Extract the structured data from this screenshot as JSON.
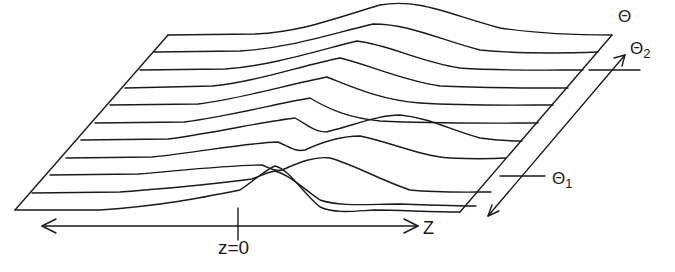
{
  "diagram": {
    "type": "3d-waterfall-profile",
    "background": "#ffffff",
    "stroke_color": "#1a1a1a",
    "axes": {
      "z": {
        "label": "Z",
        "origin_label": "z=0",
        "direction": "bidirectional-horizontal"
      },
      "theta": {
        "label": "Θ",
        "direction": "bidirectional-diagonal"
      }
    },
    "markers": {
      "theta1": {
        "label": "Θ",
        "subscript": "1"
      },
      "theta2": {
        "label": "Θ",
        "subscript": "2"
      }
    },
    "profiles": {
      "count": 11,
      "description": "Stacked profile curves along z; a hump appears at z=0 at small θ and shifts toward larger z for intermediate θ, while at large θ a broad hump sits near the center."
    }
  }
}
